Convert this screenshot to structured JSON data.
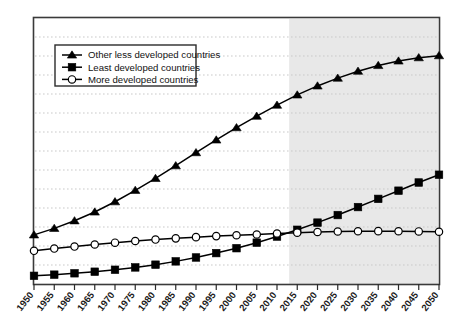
{
  "chart_data": {
    "type": "line",
    "title": "",
    "subtitle": "",
    "xlabel": "",
    "ylabel": "",
    "grid": true,
    "legend_position": "top-left",
    "xlim": [
      1950,
      2050
    ],
    "ylim": [
      0,
      6500
    ],
    "x_tick_step": 5,
    "y_gridline_count": 13,
    "x": [
      1950,
      1955,
      1960,
      1965,
      1970,
      1975,
      1980,
      1985,
      1990,
      1995,
      2000,
      2005,
      2010,
      2015,
      2020,
      2025,
      2030,
      2035,
      2040,
      2045,
      2050
    ],
    "xticklabels": [
      "1950",
      "1955",
      "1960",
      "1965",
      "1970",
      "1975",
      "1980",
      "1985",
      "1990",
      "1995",
      "2000",
      "2005",
      "2010",
      "2015",
      "2020",
      "2025",
      "2030",
      "2035",
      "2040",
      "2045",
      "2050"
    ],
    "yticklabels": [],
    "projection_start_year": 2013,
    "projection_shading_color": "#e8e8e8",
    "series": [
      {
        "name": "Other less developed countries",
        "marker": "triangle",
        "color": "#000000",
        "values": [
          1200,
          1360,
          1545,
          1760,
          2010,
          2290,
          2580,
          2890,
          3210,
          3520,
          3820,
          4100,
          4370,
          4620,
          4840,
          5030,
          5200,
          5340,
          5450,
          5530,
          5580
        ]
      },
      {
        "name": "Least developed countries",
        "marker": "square",
        "color": "#000000",
        "values": [
          200,
          228,
          262,
          300,
          348,
          405,
          472,
          553,
          648,
          755,
          875,
          1010,
          1160,
          1325,
          1500,
          1685,
          1880,
          2080,
          2280,
          2480,
          2670
        ]
      },
      {
        "name": "More developed countries",
        "marker": "circle-open",
        "color": "#000000",
        "values": [
          810,
          865,
          915,
          965,
          1010,
          1050,
          1085,
          1115,
          1145,
          1170,
          1190,
          1210,
          1235,
          1255,
          1270,
          1282,
          1290,
          1292,
          1290,
          1285,
          1278
        ]
      }
    ]
  },
  "legend": {
    "items": [
      {
        "label": "Other less developed countries",
        "marker": "triangle"
      },
      {
        "label": "Least developed countries",
        "marker": "square"
      },
      {
        "label": "More developed countries",
        "marker": "circle-open"
      }
    ]
  },
  "colors": {
    "line": "#000000",
    "plot_border": "#3a3a3a",
    "gridline": "#c9c9c9",
    "projection_band": "#e8e8e8",
    "background": "#ffffff",
    "text": "#1b1b1b"
  }
}
